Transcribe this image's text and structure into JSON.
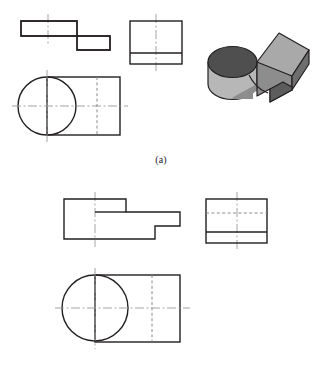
{
  "figure": {
    "kind": "orthographic-multiview-drawing",
    "background_color": "#ffffff",
    "line_color": "#231f20",
    "panels": [
      {
        "id": "a",
        "caption": "(a)",
        "has_pictorial": true
      },
      {
        "id": "b",
        "caption": "(b)",
        "has_pictorial": false
      }
    ]
  },
  "style": {
    "object_line_color": "#231f20",
    "object_line_width": 1.4,
    "hidden_line_color": "#8a8a8a",
    "hidden_line_width": 1,
    "hidden_dash": "3,2.4",
    "center_line_color": "#9a9a9a",
    "center_line_width": 0.9,
    "center_dash": "9,2.5,2,2.5",
    "solid_detail_width": 1.4,
    "pictorial_outline_color": "#231f20",
    "pictorial_outline_width": 1.2,
    "pictorial_top_face": "#a9a9a9",
    "pictorial_side_face": "#8d8d8d",
    "pictorial_front_face": "#9f9f9f",
    "pictorial_cylinder_top": "#4f4f4f",
    "pictorial_cylinder_body": "#b7b7b7",
    "pictorial_notch_dark": "#5c5c5c",
    "pictorial_end_face": "#6e6e6e"
  },
  "panel_a": {
    "caption": "(a)",
    "top_view": {
      "name": "top-view",
      "outline_points": "21,21 77,21 77,36 110,36 110,50 77,50 77,36 21,36",
      "profile": "21,21 77,21 77,36 110,36 110,50 77,50 77,36 21,36 21,21",
      "center_vertical": {
        "x": 48,
        "y1": 14,
        "y2": 43
      }
    },
    "right_view": {
      "name": "right-side-view",
      "rect": {
        "x": 130,
        "y": 21,
        "w": 52,
        "h": 43
      },
      "solid_horizontal": {
        "x1": 130,
        "x2": 182,
        "y": 53
      },
      "center_vertical": {
        "x": 156,
        "y1": 14,
        "y2": 71
      }
    },
    "front_view": {
      "name": "front-view",
      "rect": {
        "x": 47,
        "y": 77,
        "w": 73,
        "h": 58
      },
      "circle": {
        "cx": 47,
        "cy": 106,
        "r": 29
      },
      "center_horizontal": {
        "x1": 12,
        "x2": 128,
        "y": 106
      },
      "center_vertical": {
        "x": 47,
        "y1": 70,
        "y2": 142
      },
      "hidden_vertical": {
        "x": 97,
        "y1": 77,
        "y2": 135
      },
      "hidden_center_horizontal": {
        "x1": 90,
        "x2": 104,
        "y": 106
      }
    },
    "pictorial": {
      "name": "isometric-pictorial-view",
      "description": "cylinder boss merged with stepped rectangular block with end notch"
    }
  },
  "panel_b": {
    "caption": "(b)",
    "top_view": {
      "name": "top-view",
      "profile": "64,199 126,199 126,212 180,212 180,226 155,226 155,239 64,239 64,199",
      "center_vertical": {
        "x": 95,
        "y1": 192,
        "y2": 246
      }
    },
    "right_view": {
      "name": "right-side-view",
      "rect": {
        "x": 206,
        "y": 199,
        "w": 61,
        "h": 44
      },
      "hidden_horizontal": {
        "x1": 206,
        "x2": 267,
        "y": 213
      },
      "solid_horizontal": {
        "x1": 206,
        "x2": 267,
        "y": 232
      },
      "center_vertical": {
        "x": 237,
        "y1": 192,
        "y2": 250
      }
    },
    "front_view": {
      "name": "front-view",
      "rect": {
        "x": 95,
        "y": 275,
        "w": 85,
        "h": 67
      },
      "circle": {
        "cx": 95,
        "cy": 308,
        "r": 33
      },
      "center_horizontal": {
        "x1": 55,
        "x2": 190,
        "y": 308
      },
      "center_vertical": {
        "x": 95,
        "y1": 268,
        "y2": 349
      },
      "hidden_vertical": {
        "x": 152,
        "y1": 275,
        "y2": 342
      },
      "hidden_center_horizontal": {
        "x1": 144,
        "x2": 160,
        "y": 308
      }
    }
  }
}
